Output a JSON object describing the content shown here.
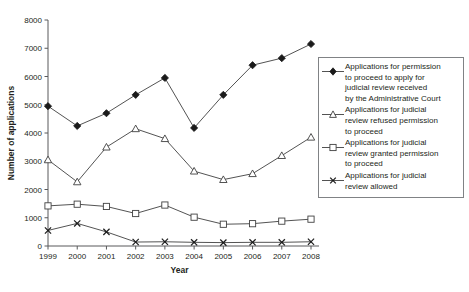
{
  "chart_data": {
    "type": "line",
    "title": "",
    "xlabel": "Year",
    "ylabel": "Number of applications",
    "categories": [
      "1999",
      "2000",
      "2001",
      "2002",
      "2003",
      "2004",
      "2005",
      "2006",
      "2007",
      "2008"
    ],
    "x": [
      1999,
      2000,
      2001,
      2002,
      2003,
      2004,
      2005,
      2006,
      2007,
      2008
    ],
    "xlim": [
      1999,
      2008
    ],
    "ylim": [
      0,
      8000
    ],
    "ytick_values": [
      0,
      1000,
      2000,
      3000,
      4000,
      5000,
      6000,
      7000,
      8000
    ],
    "ytick_labels": [
      "0",
      "1000",
      "2000",
      "3000",
      "4000",
      "5000",
      "6000",
      "7000",
      "8000"
    ],
    "grid": false,
    "legend_position": "right",
    "series": [
      {
        "name": "Applications for permission to proceed to apply for judicial review received by the Administrative Court",
        "marker": "filled-diamond",
        "values": [
          4950,
          4250,
          4700,
          5350,
          5950,
          4180,
          5350,
          6400,
          6650,
          7150
        ]
      },
      {
        "name": "Applications for judicial review refused permission to proceed",
        "marker": "open-triangle",
        "values": [
          3050,
          2270,
          3500,
          4150,
          3800,
          2650,
          2350,
          2560,
          3200,
          3850
        ]
      },
      {
        "name": "Applications for judicial review granted permission to proceed",
        "marker": "open-square",
        "values": [
          1420,
          1480,
          1400,
          1150,
          1450,
          1020,
          770,
          790,
          880,
          950
        ]
      },
      {
        "name": "Applications for judicial review allowed",
        "marker": "x",
        "values": [
          550,
          800,
          500,
          140,
          150,
          130,
          120,
          130,
          130,
          150
        ]
      }
    ]
  },
  "legend": {
    "entries": [
      {
        "marker": "filled-diamond",
        "label": "Applications for permission\nto proceed to apply for\njudicial review received\nby the Administrative Court"
      },
      {
        "marker": "open-triangle",
        "label": "Applications for judicial\nreview refused permission\nto proceed"
      },
      {
        "marker": "open-square",
        "label": "Applications for judicial\nreview granted permission\nto proceed"
      },
      {
        "marker": "x",
        "label": "Applications for judicial\nreview allowed"
      }
    ]
  }
}
